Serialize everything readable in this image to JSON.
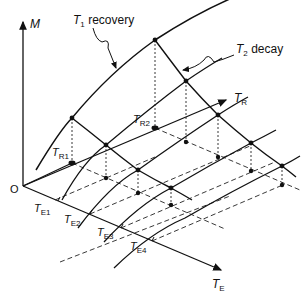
{
  "diagram": {
    "axes": {
      "vertical": {
        "label": "M"
      },
      "depth": {
        "label": "T",
        "sub": "R"
      },
      "horizontal": {
        "label": "T",
        "sub": "E"
      },
      "origin": "O"
    },
    "annotations": {
      "recovery": {
        "symbol": "T",
        "sub": "1",
        "text": " recovery"
      },
      "decay": {
        "symbol": "T",
        "sub": "2",
        "text": " decay"
      }
    },
    "tr_ticks": [
      {
        "label": "T",
        "sub": "R1"
      },
      {
        "label": "T",
        "sub": "R2"
      }
    ],
    "te_ticks": [
      {
        "label": "T",
        "sub": "E1"
      },
      {
        "label": "T",
        "sub": "E2"
      },
      {
        "label": "T",
        "sub": "E3"
      },
      {
        "label": "T",
        "sub": "E4"
      }
    ],
    "colors": {
      "ink": "#111111",
      "background": "#ffffff"
    }
  }
}
